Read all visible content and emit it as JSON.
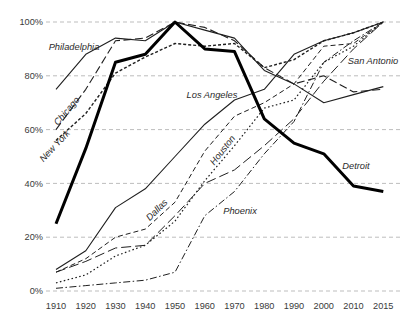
{
  "chart_data": {
    "type": "line",
    "title": "",
    "subtitle": "",
    "xlabel": "",
    "ylabel": "",
    "x_categories": [
      "1910",
      "1920",
      "1930",
      "1940",
      "1950",
      "1960",
      "1970",
      "1980",
      "1990",
      "2000",
      "2010",
      "2015"
    ],
    "y_tick_labels": [
      "0%",
      "20%",
      "40%",
      "60%",
      "80%",
      "100%"
    ],
    "ylim": [
      0,
      100
    ],
    "grid": "horizontal dashed gridlines at every 20%",
    "legend_position": "inline labels next to lines",
    "colors": {
      "line": "#1f1f1f",
      "thick_line": "#000000",
      "grid": "#bdbdbd",
      "text": "#3a3a3a"
    },
    "series": [
      {
        "name": "Philadelphia",
        "values": [
          75,
          88,
          94,
          93,
          100,
          97,
          94,
          82,
          77,
          70,
          73,
          76
        ],
        "style": {
          "dash": "none",
          "width": 1.1
        },
        "label": {
          "x": 74,
          "y": 50,
          "rotate": 0
        }
      },
      {
        "name": "Chicago",
        "values": [
          60,
          75,
          93,
          94,
          100,
          98,
          93,
          83,
          77,
          80,
          74,
          75
        ],
        "style": {
          "dash": "8,3.5",
          "width": 1.1
        },
        "label": {
          "x": 69,
          "y": 113,
          "rotate": -50
        }
      },
      {
        "name": "New York",
        "values": [
          56,
          66,
          81,
          87,
          92,
          91,
          92,
          83,
          86,
          93,
          96,
          100
        ],
        "style": {
          "dash": "3,2",
          "width": 1.4
        },
        "label": {
          "x": 57,
          "y": 148,
          "rotate": -47
        }
      },
      {
        "name": "Los Angeles",
        "values": [
          8,
          15,
          31,
          38,
          50,
          62,
          71,
          75,
          88,
          93,
          96,
          100
        ],
        "style": {
          "dash": "none",
          "width": 1.1
        },
        "label": {
          "x": 212,
          "y": 98,
          "rotate": 0
        }
      },
      {
        "name": "Houston",
        "values": [
          3,
          6,
          13,
          17,
          26,
          41,
          54,
          68,
          71,
          85,
          91,
          100
        ],
        "style": {
          "dash": "1.6,2.4",
          "width": 1.2
        },
        "label": {
          "x": 225,
          "y": 152,
          "rotate": -52
        }
      },
      {
        "name": "Dallas",
        "values": [
          7,
          12,
          20,
          23,
          33,
          52,
          65,
          70,
          77,
          91,
          92,
          100
        ],
        "style": {
          "dash": "5,3",
          "width": 1.0
        },
        "label": {
          "x": 159,
          "y": 212,
          "rotate": -45
        }
      },
      {
        "name": "San Antonio",
        "values": [
          7,
          11,
          16,
          17,
          28,
          40,
          45,
          54,
          64,
          78,
          90,
          100
        ],
        "style": {
          "dash": "10,4",
          "width": 1.0
        },
        "label": {
          "x": 373,
          "y": 64,
          "rotate": 0
        }
      },
      {
        "name": "Phoenix",
        "values": [
          1,
          2,
          3,
          4,
          7,
          28,
          37,
          51,
          63,
          85,
          93,
          100
        ],
        "style": {
          "dash": "7,2.5,1.5,2.5",
          "width": 1.0
        },
        "label": {
          "x": 240,
          "y": 214,
          "rotate": 0
        }
      },
      {
        "name": "Detroit",
        "values": [
          25,
          53,
          85,
          88,
          100,
          90,
          89,
          64,
          55,
          51,
          39,
          37
        ],
        "style": {
          "dash": "none",
          "width": 3.0
        },
        "label": {
          "x": 356,
          "y": 169,
          "rotate": 0
        }
      }
    ]
  }
}
